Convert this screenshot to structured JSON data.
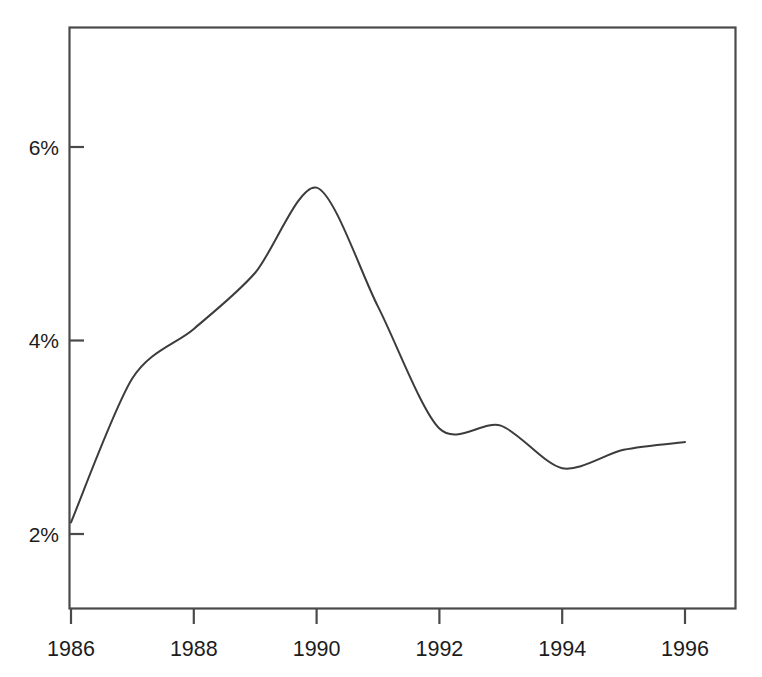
{
  "chart_data": {
    "type": "line",
    "title": "",
    "subtitle": "",
    "xlabel": "",
    "ylabel": "",
    "x": [
      1986,
      1987,
      1988,
      1989,
      1990,
      1991,
      1992,
      1993,
      1994,
      1995,
      1996
    ],
    "values": [
      2.12,
      3.61,
      4.12,
      4.7,
      5.58,
      4.35,
      3.09,
      3.12,
      2.68,
      2.87,
      2.95
    ],
    "series": [
      {
        "name": "",
        "values": [
          2.12,
          3.61,
          4.12,
          4.7,
          5.58,
          4.35,
          3.09,
          3.12,
          2.68,
          2.87,
          2.95
        ]
      }
    ],
    "xlim": [
      1986,
      1996.85
    ],
    "ylim": [
      1.23,
      7.24
    ],
    "grid": false,
    "legend": false,
    "legend_position": "none",
    "x_tick_values": [
      1986,
      1988,
      1990,
      1992,
      1994,
      1996
    ],
    "x_tick_labels": [
      "1986",
      "1988",
      "1990",
      "1992",
      "1994",
      "1996"
    ],
    "y_tick_values": [
      2,
      4,
      6
    ],
    "y_tick_labels": [
      "2%",
      "4%",
      "6%"
    ],
    "annotations": [],
    "line_color": "#3c3c3c",
    "axis_color": "#4a4a4a",
    "background_color": "#ffffff"
  },
  "axes": {
    "y_labels": [
      {
        "text": "6%",
        "value": 6
      },
      {
        "text": "4%",
        "value": 4
      },
      {
        "text": "2%",
        "value": 2
      }
    ],
    "x_labels": [
      {
        "text": "1986",
        "value": 1986
      },
      {
        "text": "1988",
        "value": 1988
      },
      {
        "text": "1990",
        "value": 1990
      },
      {
        "text": "1992",
        "value": 1992
      },
      {
        "text": "1994",
        "value": 1994
      },
      {
        "text": "1996",
        "value": 1996
      }
    ]
  }
}
